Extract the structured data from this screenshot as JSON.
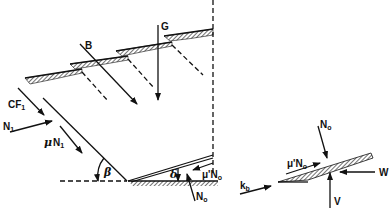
{
  "diagram": {
    "title": "",
    "labels": {
      "G": "G",
      "B": "B",
      "CF": "CF",
      "CF_sub": "1",
      "N1": "N",
      "N1_sub": "1",
      "muN1_mu": "μ",
      "muN1": "N",
      "muN1_sub": "1",
      "beta": "β",
      "delta": "δ",
      "muPrimeN0_left": "μ'N",
      "muPrimeN0_left_sub": "o",
      "N0_left": "N",
      "N0_left_sub": "o",
      "kb": "k",
      "kb_sub": "b",
      "N0_right": "N",
      "N0_right_sub": "o",
      "muPrimeN0_right": "μ'N",
      "muPrimeN0_right_sub": "o",
      "W": "W",
      "V": "V"
    },
    "colors": {
      "ink": "#111111",
      "background": "#ffffff"
    }
  }
}
